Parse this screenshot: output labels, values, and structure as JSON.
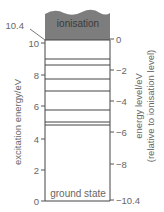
{
  "diagram": {
    "ionisation_label": "ionisation",
    "ionisation_value_label": "10.4",
    "ground_label": "ground state",
    "left_axis": {
      "title": "excitation energy/eV",
      "ticks": [
        "10",
        "8",
        "6",
        "4",
        "2",
        "0"
      ]
    },
    "right_axis": {
      "title_line1": "energy level/eV",
      "title_line2": "(relative to ionisation level)",
      "ticks": [
        "0",
        "−2",
        "−4",
        "−6",
        "−8",
        "−10.4"
      ]
    },
    "excitation_levels_eV": [
      9.2,
      8.8,
      7.9,
      7.1,
      5.8,
      5.1,
      4.9
    ],
    "colors": {
      "ionisation_fill": "#7d7d7d",
      "line": "#444444",
      "text": "#666666"
    }
  }
}
